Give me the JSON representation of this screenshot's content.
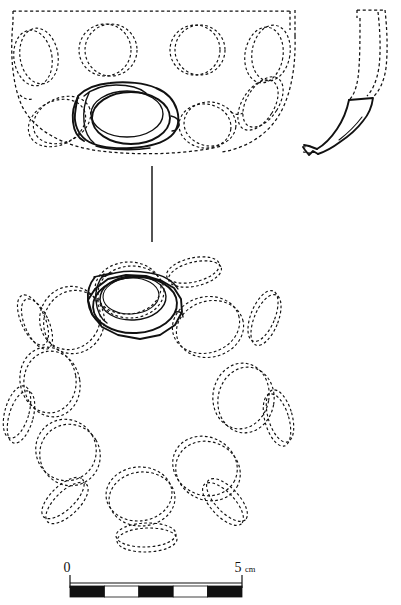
{
  "figure": {
    "kind": "archaeological-vessel-drawing",
    "line_color": "#111111",
    "background_color": "#ffffff",
    "views": [
      {
        "id": "profile-view",
        "name": "Reconstructed profile / side elevation",
        "rim_style": "dashed",
        "boss_count_upper_row": 4,
        "boss_count_lower_row": 3,
        "surviving_sherd": "central lug and boss drawn in solid line"
      },
      {
        "id": "section-fragment",
        "name": "Wall section fragment",
        "style": "solid outline with dashed reconstruction"
      },
      {
        "id": "plan-view",
        "name": "Plan view from above",
        "boss_count_outer_ring": 8,
        "lens_count_perimeter": 8,
        "surviving_sherd": "one boss and lug drawn in solid line"
      }
    ],
    "divider": {
      "name": "view-separator-rule",
      "orientation": "vertical"
    }
  },
  "scale_bar": {
    "name": "scale-bar",
    "start_label": "0",
    "end_label": "5",
    "unit_label": "cm",
    "total_length_cm": 5,
    "segment_count": 5,
    "segment_length_cm": 1,
    "segment_colors": [
      "#111111",
      "#ffffff",
      "#111111",
      "#ffffff",
      "#111111"
    ],
    "tick_positions_cm": [
      0,
      5
    ]
  }
}
